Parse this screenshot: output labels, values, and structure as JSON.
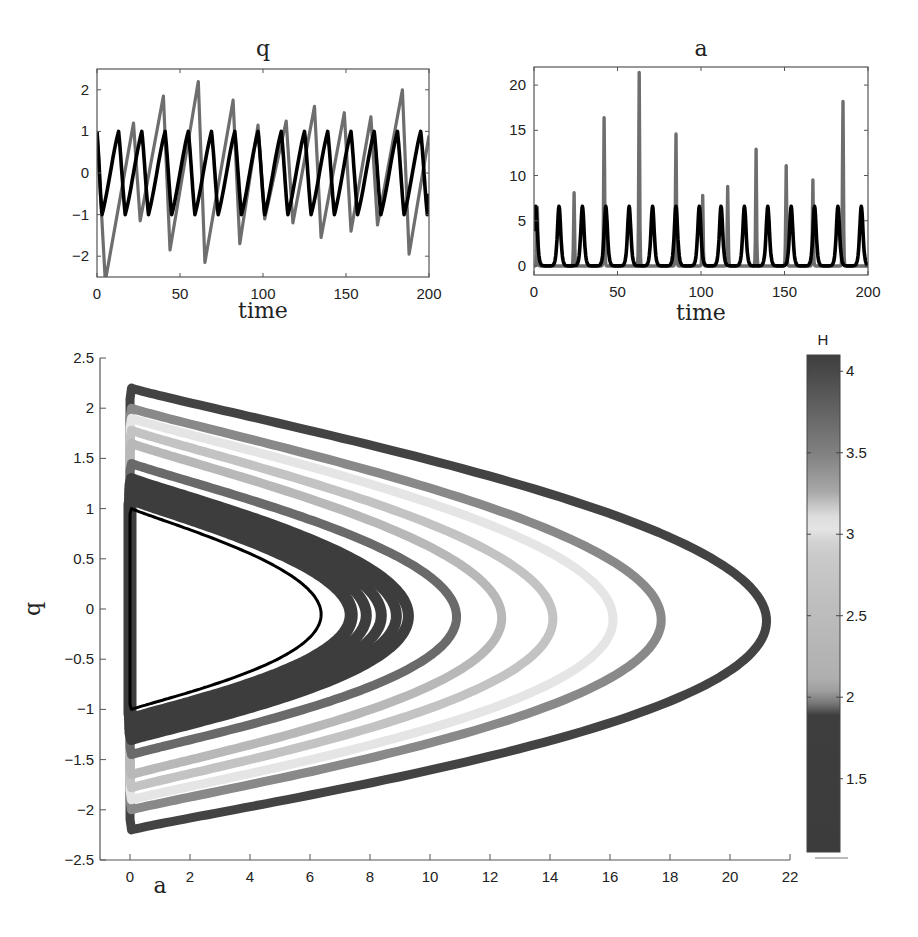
{
  "chart_data": [
    {
      "id": "q_time",
      "type": "line",
      "title": "q",
      "xlabel": "time",
      "ylabel": "",
      "xlim": [
        0,
        200
      ],
      "ylim": [
        -2.5,
        2.5
      ],
      "xticks": [
        0,
        50,
        100,
        150,
        200
      ],
      "yticks": [
        -2,
        -1,
        0,
        1,
        2
      ],
      "grid": false,
      "series": [
        {
          "name": "chaotic trajectory",
          "color": "#6e6e6e",
          "x": [
            0,
            5,
            22,
            26,
            40,
            44,
            61,
            65,
            82,
            86,
            97,
            101,
            114,
            118,
            131,
            135,
            149,
            153,
            165,
            169,
            184,
            188,
            200
          ],
          "y": [
            1.0,
            -2.6,
            1.2,
            -1.15,
            1.85,
            -1.85,
            2.2,
            -2.15,
            1.75,
            -1.7,
            1.15,
            -1.1,
            1.25,
            -1.2,
            1.6,
            -1.55,
            1.45,
            -1.4,
            1.35,
            -1.25,
            2.0,
            -1.95,
            0.9
          ]
        },
        {
          "name": "periodic trajectory",
          "color": "#000000",
          "x": [
            0,
            3,
            13,
            17,
            27,
            31,
            41,
            45,
            55,
            59,
            69,
            73,
            83,
            87,
            97,
            101,
            111,
            115,
            125,
            129,
            139,
            143,
            153,
            157,
            167,
            171,
            181,
            185,
            195,
            199,
            200
          ],
          "y": [
            1.0,
            -1.0,
            1.0,
            -1.0,
            1.0,
            -1.0,
            1.0,
            -1.0,
            1.0,
            -1.0,
            1.0,
            -1.0,
            1.0,
            -1.0,
            1.0,
            -1.0,
            1.0,
            -1.0,
            1.0,
            -1.0,
            1.0,
            -1.0,
            1.0,
            -1.0,
            1.0,
            -1.0,
            1.0,
            -1.0,
            1.0,
            -1.0,
            -0.5
          ]
        }
      ]
    },
    {
      "id": "a_time",
      "type": "line",
      "title": "a",
      "xlabel": "time",
      "ylabel": "",
      "xlim": [
        0,
        200
      ],
      "ylim": [
        -1,
        22
      ],
      "xticks": [
        0,
        50,
        100,
        150,
        200
      ],
      "yticks": [
        0,
        5,
        10,
        15,
        20
      ],
      "grid": false,
      "series": [
        {
          "name": "chaotic trajectory",
          "color": "#6e6e6e",
          "peaks_t": [
            2,
            24,
            42,
            63,
            85,
            101,
            116,
            133,
            151,
            167,
            185
          ],
          "peaks_a": [
            6.5,
            8.1,
            16.4,
            21.4,
            14.6,
            7.8,
            8.8,
            12.9,
            11.1,
            9.5,
            18.2
          ]
        },
        {
          "name": "periodic trajectory",
          "color": "#000000",
          "peaks_t": [
            1,
            15,
            29,
            43,
            57,
            71,
            85,
            99,
            112,
            126,
            140,
            154,
            168,
            182,
            196
          ],
          "peaks_a": [
            6.6,
            6.6,
            6.6,
            6.6,
            6.6,
            6.6,
            6.6,
            6.6,
            6.6,
            6.6,
            6.6,
            6.6,
            6.6,
            6.6,
            6.6
          ]
        }
      ]
    },
    {
      "id": "phase_portrait",
      "type": "scatter",
      "title": "",
      "xlabel": "a",
      "ylabel": "q",
      "xlim": [
        -1,
        22
      ],
      "ylim": [
        -2.5,
        2.5
      ],
      "xticks": [
        0,
        2,
        4,
        6,
        8,
        10,
        12,
        14,
        16,
        18,
        20,
        22
      ],
      "yticks": [
        -2.5,
        -2,
        -1.5,
        -1,
        -0.5,
        0,
        0.5,
        1,
        1.5,
        2,
        2.5
      ],
      "grid": false,
      "colorbar": {
        "label": "H",
        "range": [
          1.05,
          4.1
        ],
        "ticks": [
          1.5,
          2,
          2.5,
          3,
          3.5,
          4
        ]
      },
      "orbits": [
        {
          "a_max": 21.1,
          "q_max": 2.2,
          "H": 4.05,
          "width": 9
        },
        {
          "a_max": 17.6,
          "q_max": 2.0,
          "H": 3.45,
          "width": 9
        },
        {
          "a_max": 16.0,
          "q_max": 1.9,
          "H": 3.0,
          "width": 9
        },
        {
          "a_max": 14.0,
          "q_max": 1.78,
          "H": 2.7,
          "width": 9
        },
        {
          "a_max": 12.3,
          "q_max": 1.65,
          "H": 2.4,
          "width": 9
        },
        {
          "a_max": 10.8,
          "q_max": 1.45,
          "H": 1.95,
          "width": 9
        },
        {
          "a_max": 9.2,
          "q_max": 1.3,
          "H": 1.3,
          "width": 11
        },
        {
          "a_max": 8.8,
          "q_max": 1.25,
          "H": 1.3,
          "width": 11
        },
        {
          "a_max": 8.3,
          "q_max": 1.2,
          "H": 1.3,
          "width": 11
        },
        {
          "a_max": 7.8,
          "q_max": 1.15,
          "H": 1.3,
          "width": 11
        },
        {
          "a_max": 7.3,
          "q_max": 1.1,
          "H": 1.3,
          "width": 13
        },
        {
          "a_max": 6.3,
          "q_max": 1.0,
          "H": 1.0,
          "width": 3,
          "color": "#000000"
        }
      ]
    }
  ]
}
